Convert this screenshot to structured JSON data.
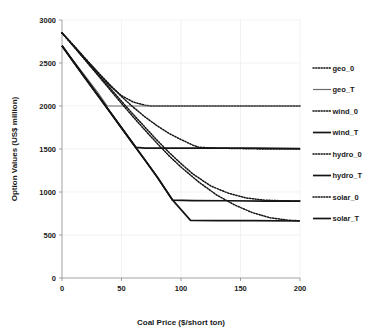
{
  "chart_data": {
    "type": "line",
    "title": "",
    "xlabel": "Coal Price ($/short ton)",
    "ylabel": "Option Values (US$ million)",
    "xlim": [
      0,
      200
    ],
    "ylim": [
      0,
      3000
    ],
    "xticks": [
      "0",
      "50",
      "100",
      "150",
      "200"
    ],
    "xtick_values": [
      0,
      50,
      100,
      150,
      200
    ],
    "yticks": [
      "0",
      "500",
      "1000",
      "1500",
      "2000",
      "2500",
      "3000"
    ],
    "ytick_values": [
      0,
      500,
      1000,
      1500,
      2000,
      2500,
      3000
    ],
    "grid": false,
    "legend_position": "right",
    "series": [
      {
        "name": "geo_0",
        "style": "dotted",
        "x": [
          0,
          10,
          20,
          30,
          40,
          50,
          60,
          70,
          75,
          80,
          100,
          120,
          140,
          160,
          180,
          200
        ],
        "values": [
          2850,
          2700,
          2545,
          2390,
          2240,
          2120,
          2045,
          2008,
          2000,
          2000,
          2000,
          2000,
          2000,
          2000,
          2000,
          2000
        ]
      },
      {
        "name": "geo_T",
        "style": "solid-thin",
        "x": [
          0,
          10,
          20,
          30,
          38,
          40,
          60,
          80,
          100,
          120,
          140,
          160,
          180,
          200
        ],
        "values": [
          2700,
          2520,
          2340,
          2160,
          2000,
          2000,
          2000,
          2000,
          2000,
          2000,
          2000,
          2000,
          2000,
          2000
        ]
      },
      {
        "name": "wind_0",
        "style": "dotted",
        "x": [
          0,
          10,
          20,
          30,
          40,
          50,
          60,
          70,
          80,
          90,
          100,
          110,
          115,
          130,
          150,
          170,
          200
        ],
        "values": [
          2850,
          2700,
          2545,
          2395,
          2250,
          2110,
          1985,
          1870,
          1770,
          1680,
          1610,
          1545,
          1520,
          1510,
          1505,
          1500,
          1500
        ]
      },
      {
        "name": "wind_T",
        "style": "solid",
        "x": [
          0,
          10,
          20,
          30,
          40,
          50,
          62,
          70,
          100,
          130,
          160,
          200
        ],
        "values": [
          2700,
          2510,
          2320,
          2130,
          1940,
          1750,
          1520,
          1510,
          1510,
          1510,
          1510,
          1505
        ]
      },
      {
        "name": "hydro_0",
        "style": "dotted",
        "x": [
          0,
          10,
          20,
          30,
          40,
          50,
          60,
          70,
          80,
          90,
          100,
          110,
          125,
          140,
          155,
          170,
          185,
          200
        ],
        "values": [
          2850,
          2690,
          2530,
          2370,
          2215,
          2055,
          1900,
          1750,
          1600,
          1460,
          1330,
          1210,
          1070,
          985,
          930,
          905,
          898,
          895
        ]
      },
      {
        "name": "hydro_T",
        "style": "solid",
        "x": [
          0,
          10,
          20,
          30,
          40,
          50,
          60,
          70,
          80,
          93,
          110,
          140,
          170,
          200
        ],
        "values": [
          2700,
          2505,
          2315,
          2125,
          1935,
          1745,
          1555,
          1365,
          1175,
          905,
          900,
          898,
          895,
          893
        ]
      },
      {
        "name": "solar_0",
        "style": "dotted",
        "x": [
          0,
          10,
          20,
          30,
          40,
          50,
          60,
          70,
          80,
          90,
          100,
          115,
          130,
          145,
          160,
          175,
          190,
          200
        ],
        "values": [
          2850,
          2690,
          2525,
          2360,
          2195,
          2030,
          1870,
          1715,
          1565,
          1420,
          1290,
          1115,
          965,
          850,
          760,
          700,
          672,
          665
        ]
      },
      {
        "name": "solar_T",
        "style": "solid",
        "x": [
          0,
          10,
          20,
          30,
          40,
          50,
          60,
          70,
          80,
          93,
          108,
          130,
          160,
          200
        ],
        "values": [
          2700,
          2505,
          2315,
          2125,
          1935,
          1745,
          1555,
          1365,
          1175,
          905,
          670,
          668,
          666,
          663
        ]
      }
    ]
  },
  "legend": {
    "items": [
      {
        "label": "geo_0",
        "style": "dotted"
      },
      {
        "label": "geo_T",
        "style": "solid-thin"
      },
      {
        "label": "wind_0",
        "style": "dotted"
      },
      {
        "label": "wind_T",
        "style": "solid"
      },
      {
        "label": "hydro_0",
        "style": "dotted"
      },
      {
        "label": "hydro_T",
        "style": "solid"
      },
      {
        "label": "solar_0",
        "style": "dotted"
      },
      {
        "label": "solar_T",
        "style": "solid"
      }
    ]
  },
  "colors": {
    "line": "#141414",
    "line_light": "#6b6b6b",
    "axis": "#8a8a8a",
    "text": "#1a1a1a",
    "background": "#ffffff"
  }
}
